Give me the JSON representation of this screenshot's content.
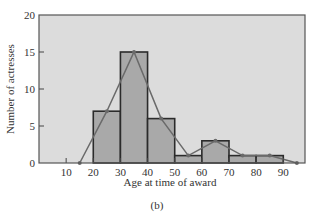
{
  "chart_data": {
    "type": "bar",
    "subtype": "histogram-with-frequency-polygon",
    "title": "",
    "caption": "(b)",
    "xlabel": "Age at time of award",
    "ylabel": "Number of actresses",
    "xlim": [
      0,
      98
    ],
    "ylim": [
      0,
      20
    ],
    "x_ticks": [
      10,
      20,
      30,
      40,
      50,
      60,
      70,
      80,
      90
    ],
    "y_ticks": [
      0,
      5,
      10,
      15,
      20
    ],
    "grid": false,
    "legend": null,
    "bins": [
      {
        "from": 20,
        "to": 30,
        "count": 7
      },
      {
        "from": 30,
        "to": 40,
        "count": 15
      },
      {
        "from": 40,
        "to": 50,
        "count": 6
      },
      {
        "from": 50,
        "to": 60,
        "count": 1
      },
      {
        "from": 60,
        "to": 70,
        "count": 3
      },
      {
        "from": 70,
        "to": 80,
        "count": 1
      },
      {
        "from": 80,
        "to": 90,
        "count": 1
      }
    ],
    "categories": [
      "20-30",
      "30-40",
      "40-50",
      "50-60",
      "60-70",
      "70-80",
      "80-90"
    ],
    "values": [
      7,
      15,
      6,
      1,
      3,
      1,
      1
    ],
    "frequency_polygon": {
      "x": [
        15,
        25,
        35,
        45,
        55,
        65,
        75,
        85,
        95
      ],
      "y": [
        0,
        7,
        15,
        6,
        1,
        3,
        1,
        1,
        0
      ]
    },
    "colors": {
      "plot_background": "#dcdcdc",
      "bar_fill": "#a9a9a9",
      "bar_stroke": "#2b2b2b",
      "polygon_line": "#6a6a6a",
      "frame": "#555555"
    }
  }
}
